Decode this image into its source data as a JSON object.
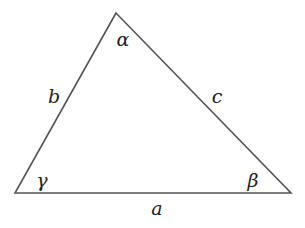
{
  "diagram": {
    "type": "triangle",
    "stroke_color": "#555555",
    "label_color": "#222222",
    "background": "#ffffff",
    "vertices": {
      "apex": {
        "x": 116,
        "y": 13
      },
      "bottom_left": {
        "x": 15,
        "y": 193
      },
      "bottom_right": {
        "x": 291,
        "y": 193
      }
    },
    "angles": {
      "alpha": {
        "label": "α",
        "x": 123,
        "y": 46
      },
      "beta": {
        "label": "β",
        "x": 253,
        "y": 187
      },
      "gamma": {
        "label": "γ",
        "x": 42,
        "y": 187
      }
    },
    "sides": {
      "a": {
        "label": "a",
        "x": 157,
        "y": 215
      },
      "b": {
        "label": "b",
        "x": 54,
        "y": 103
      },
      "c": {
        "label": "c",
        "x": 217,
        "y": 103
      }
    }
  }
}
